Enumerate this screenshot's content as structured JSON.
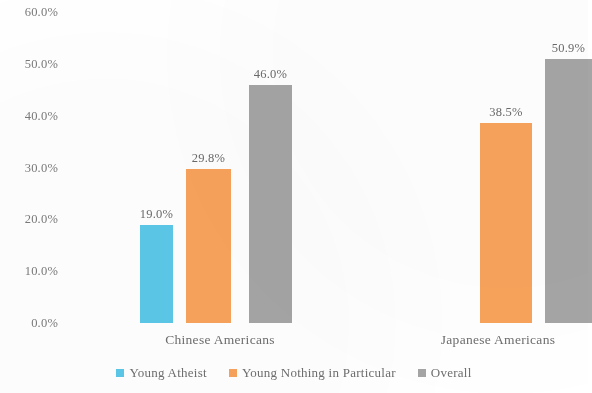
{
  "chart_data": {
    "type": "bar",
    "title": "",
    "subtitle": "",
    "xlabel": "",
    "ylabel": "",
    "categories": [
      "Chinese Americans",
      "Japanese Americans"
    ],
    "series": [
      {
        "name": "Young Atheist",
        "color": "#5BC8E8",
        "values": [
          19.0,
          null
        ],
        "labels": [
          "19.0%",
          ""
        ]
      },
      {
        "name": "Young Nothing in Particular",
        "color": "#F8A35C",
        "values": [
          29.8,
          38.5
        ],
        "labels": [
          "29.8%",
          "38.5%"
        ]
      },
      {
        "name": "Overall",
        "color": "#A5A5A5",
        "values": [
          46.0,
          50.9
        ],
        "labels": [
          "46.0%",
          "50.9%"
        ]
      }
    ],
    "ylim": [
      0,
      60
    ],
    "ytick_values": [
      0,
      10,
      20,
      30,
      40,
      50,
      60
    ],
    "ytick_labels": [
      "0.0%",
      "10.0%",
      "20.0%",
      "30.0%",
      "40.0%",
      "50.0%",
      "60.0%"
    ],
    "grid": false,
    "legend_position": "bottom",
    "value_labels_shown": true
  },
  "legend": {
    "items": [
      {
        "label": "Young Atheist",
        "color": "#5BC8E8"
      },
      {
        "label": "Young Nothing in Particular",
        "color": "#F8A35C"
      },
      {
        "label": "Overall",
        "color": "#A5A5A5"
      }
    ]
  },
  "axis": {
    "y_ticks": [
      {
        "label": "60.0%",
        "value": 60
      },
      {
        "label": "50.0%",
        "value": 50
      },
      {
        "label": "40.0%",
        "value": 40
      },
      {
        "label": "30.0%",
        "value": 30
      },
      {
        "label": "20.0%",
        "value": 20
      },
      {
        "label": "10.0%",
        "value": 10
      },
      {
        "label": "0.0%",
        "value": 0
      }
    ],
    "x_categories": [
      {
        "label": "Chinese Americans"
      },
      {
        "label": "Japanese Americans"
      }
    ]
  }
}
